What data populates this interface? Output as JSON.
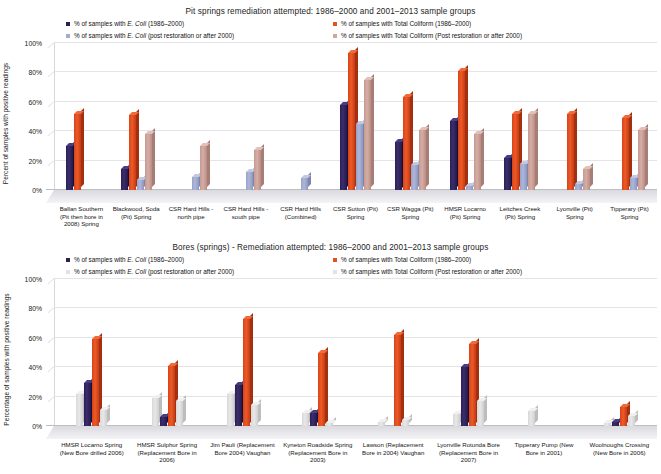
{
  "colors": {
    "ecoli_old": "#2a1f52",
    "tc_old": "#e0521f",
    "ecoli_new": "#a3abd0",
    "tc_new": "#cfa79f",
    "tc_new_pale": "#e2e2e2",
    "grid": "#e3e3e8"
  },
  "charts": [
    {
      "id": "pit-springs",
      "title": "Pit springs remediation attempted: 1986–2000 and 2001–2013 sample groups",
      "ylabel": "Percent of samples with positive readings",
      "legend": [
        {
          "label_html": "% of samples with <i>E. Coli</i> (1986–2000)",
          "label": "% of samples with E. Coli (1986–2000)",
          "color": "#2a1f52",
          "col": "left"
        },
        {
          "label_html": "% of samples with <i>E. Coli</i> (post restoration or after 2000)",
          "label": "% of samples with E. Coli (post restoration or after 2000)",
          "color": "#a3abd0",
          "col": "left"
        },
        {
          "label_html": "% of samples with Total Coliform (1986–2000)",
          "label": "% of samples with Total Coliform (1986–2000)",
          "color": "#e0521f",
          "col": "right"
        },
        {
          "label_html": "% of samples with Total Coliform (Post restoration or after 2000)",
          "label": "% of samples with Total Coliform (Post restoration or after 2000)",
          "color": "#cfa79f",
          "col": "right"
        }
      ],
      "yticks": [
        "0%",
        "20%",
        "40%",
        "60%",
        "80%",
        "100%"
      ],
      "categories": [
        "Ballan Southern (Pit then bore in 2008) Spring",
        "Blackwood, Soda (Pit) Spring",
        "CSR Hard Hills - north pipe",
        "CSR Hard Hills - south pipe",
        "CSR Hard Hills (Combined)",
        "CSR Sutton (Pit) Spring",
        "CSR Wagga (Pit) Spring",
        "HMSR Locarno (Pit) Spring",
        "Leitches Creek (Pit) Spring",
        "Lyonville (Pit) Spring",
        "Tipperary (Pit) Spring"
      ],
      "series": [
        {
          "name": "% of samples with E. Coli (1986–2000)",
          "key": "ecoli_old",
          "values": [
            30,
            14,
            0,
            0,
            0,
            58,
            33,
            47,
            22,
            0,
            0
          ]
        },
        {
          "name": "% of samples with Total Coliform (1986–2000)",
          "key": "tc_old",
          "values": [
            52,
            51,
            0,
            0,
            0,
            93,
            63,
            81,
            52,
            52,
            49
          ]
        },
        {
          "name": "% of samples with E. Coli (post restoration or after 2000)",
          "key": "ecoli_new",
          "values": [
            0,
            7,
            9,
            12,
            8,
            45,
            17,
            3,
            18,
            4,
            8
          ]
        },
        {
          "name": "% of samples with Total Coliform (Post restoration or after 2000)",
          "key": "tc_new",
          "values": [
            0,
            38,
            30,
            27,
            0,
            75,
            41,
            38,
            52,
            14,
            41
          ]
        }
      ]
    },
    {
      "id": "bores-springs",
      "title": "Bores (springs) - Remediation attempted: 1986–2000 and 2001–2013 sample groups",
      "ylabel": "Percentage of samples with positive readings",
      "legend": [
        {
          "label_html": "% of samples with <i>E. Coli</i> (1986–2000)",
          "label": "% of samples with E. Coli (1986–2000)",
          "color": "#2a1f52",
          "col": "left"
        },
        {
          "label_html": "% of samples with <i>E. Coli</i> (post restoration or after 2000)",
          "label": "% of samples with E. Coli (post restoration or after 2000)",
          "color": "#e2e2e2",
          "col": "left"
        },
        {
          "label_html": "% of samples with Total Coliform (1986–2000)",
          "label": "% of samples with Total Coliform (1986–2000)",
          "color": "#e0521f",
          "col": "right"
        },
        {
          "label_html": "% of samples with Total Coliform (Post restoration or after 2000)",
          "label": "% of samples with Total Coliform (Post restoration or after 2000)",
          "color": "#e2e2e2",
          "col": "right"
        }
      ],
      "yticks": [
        "0%",
        "20%",
        "40%",
        "60%",
        "80%",
        "100%"
      ],
      "categories": [
        "HMSR Locarno Spring (New Bore drilled 2006)",
        "HMSR Sulphur Spring (Replacement Bore in 2006)",
        "Jim Pauli (Replacement Bore 2004) Vaughan",
        "Kyneton Roadside Spring (Replacement Bore in 2003)",
        "Lawson (Replacement Bore in 2004) Vaughan",
        "Lyonville Rotunda Bore (Replacement Bore in 2007)",
        "Tipperary Pump (New Bore in 2001)",
        "Woolnoughs Crossing (New Bore in 2006)"
      ],
      "series": [
        {
          "name": "% of samples with Total Coliform (Post restoration or after 2000)",
          "key": "tc_new_pre",
          "values": [
            22,
            19,
            22,
            9,
            3,
            8,
            10,
            2
          ]
        },
        {
          "name": "% of samples with E. Coli (1986–2000)",
          "key": "ecoli_old",
          "values": [
            29,
            6,
            28,
            9,
            0,
            40,
            0,
            3
          ]
        },
        {
          "name": "% of samples with Total Coliform (1986–2000)",
          "key": "tc_old",
          "values": [
            59,
            41,
            73,
            50,
            62,
            56,
            0,
            13
          ]
        },
        {
          "name": "% of samples with E. Coli (post restoration or after 2000)",
          "key": "ecoli_new",
          "values": [
            11,
            17,
            14,
            2,
            4,
            17,
            0,
            7
          ]
        }
      ]
    }
  ]
}
